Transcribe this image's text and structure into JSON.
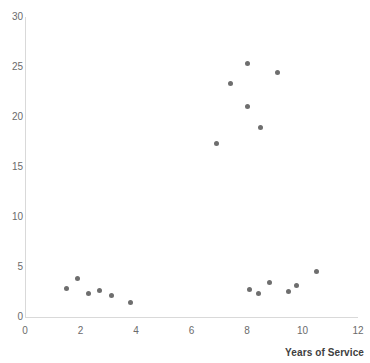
{
  "chart_data": {
    "type": "scatter",
    "title": "",
    "xlabel": "Years of Service",
    "ylabel": "",
    "xlim": [
      0,
      12
    ],
    "ylim": [
      0,
      30
    ],
    "xticks": [
      0,
      2,
      4,
      6,
      8,
      10,
      12
    ],
    "yticks": [
      0,
      5,
      10,
      15,
      20,
      25,
      30
    ],
    "grid": false,
    "legend": false,
    "marker_color": "#6e6e6e",
    "axis_color": "#d9d9d9",
    "tick_label_color": "#6b6b6b",
    "series": [
      {
        "name": "Observations",
        "points": [
          [
            1.5,
            2.9
          ],
          [
            1.9,
            3.9
          ],
          [
            2.3,
            2.4
          ],
          [
            2.7,
            2.7
          ],
          [
            3.1,
            2.2
          ],
          [
            3.8,
            1.5
          ],
          [
            6.9,
            17.4
          ],
          [
            7.4,
            23.4
          ],
          [
            8.0,
            25.4
          ],
          [
            8.0,
            21.1
          ],
          [
            8.5,
            19.0
          ],
          [
            9.1,
            24.5
          ],
          [
            8.1,
            2.8
          ],
          [
            8.4,
            2.4
          ],
          [
            8.8,
            3.5
          ],
          [
            9.5,
            2.6
          ],
          [
            9.8,
            3.2
          ],
          [
            10.5,
            4.6
          ]
        ]
      }
    ]
  },
  "axes": {
    "x_title": "Years of Service",
    "x_tick_labels": [
      "0",
      "2",
      "4",
      "6",
      "8",
      "10",
      "12"
    ],
    "y_tick_labels": [
      "0",
      "5",
      "10",
      "15",
      "20",
      "25",
      "30"
    ]
  }
}
